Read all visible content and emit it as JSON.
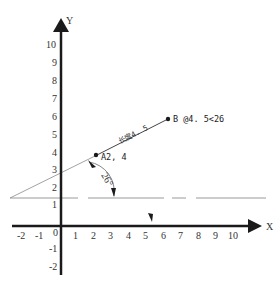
{
  "diagram": {
    "axes": {
      "x_label": "X",
      "y_label": "Y",
      "origin_label": "0",
      "x_ticks": [
        "-2",
        "-1",
        "1",
        "2",
        "3",
        "4",
        "5",
        "6",
        "7",
        "8",
        "9",
        "10"
      ],
      "y_ticks": [
        "10",
        "9",
        "8",
        "7",
        "6",
        "5",
        "4",
        "3",
        "2",
        "1",
        "-1",
        "-2"
      ]
    },
    "points": {
      "A": {
        "label": "A2, 4",
        "x": 2,
        "y": 4
      },
      "B": {
        "label": "B @4. 5<26"
      }
    },
    "segment": {
      "length_label": "长度4. 5"
    },
    "angle": {
      "label": "26°"
    },
    "reference_line": {
      "y": 1.5,
      "style": "dashed"
    },
    "colors": {
      "axis": "#1a1a1a",
      "line": "#555555",
      "dashed": "#999999"
    }
  }
}
